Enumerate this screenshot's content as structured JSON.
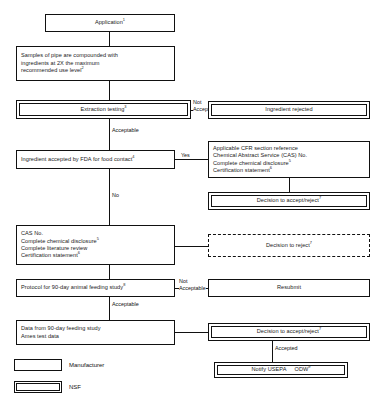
{
  "figure": {
    "type": "flowchart",
    "orientation": "top-to-bottom"
  },
  "nodes": {
    "application": {
      "label": "Application",
      "sup": "1",
      "owner": "Manufacturer"
    },
    "samples": {
      "line1": "Samples of pipe are compounded with",
      "line2": "ingredients at 2X the maximum",
      "line3": "recommended use level",
      "sup": "2",
      "owner": "Manufacturer"
    },
    "extraction_testing": {
      "label": "Extraction testing",
      "sup": "3",
      "owner": "NSF"
    },
    "ingredient_rejected": {
      "label": "Ingredient rejected",
      "sup": "",
      "owner": "NSF"
    },
    "fda_accepted": {
      "label": "Ingredient accepted by FDA for food contact",
      "sup": "4",
      "owner": "Manufacturer"
    },
    "cfr_packet": {
      "line1": "Applicable CFR section reference",
      "line2": "Chemical Abstract Service (CAS) No.",
      "line3": "Complete chemical disclosure",
      "line3_sup": "5",
      "line4": "Certification statement",
      "line4_sup": "6",
      "owner": "Manufacturer"
    },
    "decision_accept_reject_1": {
      "label": "Decision to accept/reject",
      "sup": "7",
      "owner": "NSF"
    },
    "cas_packet": {
      "line1": "CAS No.",
      "line2": "Complete chemical disclosure",
      "line2_sup": "5",
      "line3": "Complete literature review",
      "line4": "Certification statement",
      "line4_sup": "6",
      "owner": "Manufacturer"
    },
    "decision_reject": {
      "label": "Decision to reject",
      "sup": "7",
      "owner": "NSF-dashed"
    },
    "protocol_90day": {
      "label": "Protocol for 90-day animal feeding study",
      "sup": "8",
      "owner": "Manufacturer"
    },
    "resubmit": {
      "label": "Resubmit",
      "sup": "",
      "owner": "Manufacturer"
    },
    "data_90day": {
      "line1": "Data from 90-day feeding study",
      "line2": "Ames test data",
      "owner": "Manufacturer"
    },
    "decision_accept_reject_2": {
      "label": "Decision to accept/reject",
      "sup": "7",
      "owner": "NSF"
    },
    "notify": {
      "label_a": "Notify USEPA",
      "label_b": "ODW",
      "sup": "9",
      "owner": "NSF"
    }
  },
  "edges": {
    "not_acceptable_1": {
      "line1": "Not",
      "line2": "Acceptable"
    },
    "acceptable_1": {
      "label": "Acceptable"
    },
    "yes": {
      "label": "Yes"
    },
    "no": {
      "label": "No"
    },
    "not_acceptable_2": {
      "line1": "Not",
      "line2": "Acceptable"
    },
    "acceptable_2": {
      "label": "Acceptable"
    },
    "accepted": {
      "label": "Accepted"
    }
  },
  "legend": {
    "items": [
      {
        "key": "manufacturer",
        "label": "Manufacturer",
        "style": "single-border"
      },
      {
        "key": "nsf",
        "label": "NSF",
        "style": "double-border"
      }
    ]
  },
  "colors": {
    "stroke": "#111111",
    "background": "#ffffff",
    "text": "#1a1a1a"
  }
}
